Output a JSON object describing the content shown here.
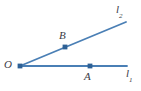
{
  "figure": {
    "background_color": "#ffffff",
    "line_color": "#4a7fb5",
    "point_color": "#2e6196",
    "label_color": "#3c3c46",
    "width": 141,
    "height": 91
  },
  "labels": {
    "vertex": "O",
    "point_a": "A",
    "point_b": "B",
    "line1": "l",
    "line1_sub": "1",
    "line2": "l",
    "line2_sub": "2"
  },
  "geometry": {
    "vertex": {
      "x": 20,
      "y": 66
    },
    "ray1": {
      "from": {
        "x": 20,
        "y": 66
      },
      "to": {
        "x": 127,
        "y": 66
      }
    },
    "ray2": {
      "from": {
        "x": 20,
        "y": 66
      },
      "to": {
        "x": 126,
        "y": 22
      }
    },
    "point_a": {
      "x": 90,
      "y": 66
    },
    "point_b": {
      "x": 65,
      "y": 47
    }
  }
}
